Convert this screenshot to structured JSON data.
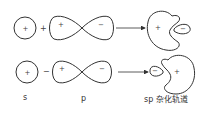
{
  "diagram": {
    "rows": [
      {
        "s_sign": "+",
        "operator": "+",
        "p_signs": [
          "+",
          "−"
        ],
        "result_signs": [
          "+",
          "−"
        ],
        "result_orientation": "large lobe left, small lobe right"
      },
      {
        "s_sign": "+",
        "operator": "−",
        "p_signs": [
          "+",
          "−"
        ],
        "result_signs": [
          "−",
          "+"
        ],
        "result_orientation": "small lobe left, large lobe right"
      }
    ],
    "labels": {
      "s": "s",
      "p": "p",
      "sp": "sp 杂化轨道"
    },
    "colors": {
      "stroke": "#333333",
      "background": "#ffffff"
    }
  }
}
